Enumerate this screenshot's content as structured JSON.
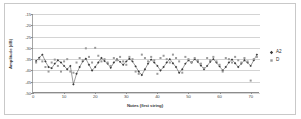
{
  "figure": {
    "y_axis_title": "Amplitude (dB)",
    "x_axis_title": "Notes (first string)",
    "legend": [
      {
        "label": "A2",
        "marker": "diamond-marker",
        "color": "#3a3a3a"
      },
      {
        "label": "D",
        "marker": "square-marker",
        "color": "#9a9a9a"
      }
    ]
  },
  "chart_data": {
    "type": "line",
    "title": "",
    "xlabel": "Notes (first string)",
    "ylabel": "Amplitude (dB)",
    "xlim": [
      0,
      73
    ],
    "ylim": [
      -50,
      -15
    ],
    "xticks": [
      0,
      10,
      20,
      30,
      40,
      50,
      60,
      70
    ],
    "yticks": [
      -15,
      -20,
      -25,
      -30,
      -35,
      -40,
      -45,
      -50
    ],
    "grid": true,
    "legend_position": "right",
    "series": [
      {
        "name": "A2",
        "marker": "diamond",
        "color": "#3a3a3a",
        "line": true,
        "x": [
          1,
          2,
          3,
          4,
          5,
          6,
          7,
          8,
          9,
          10,
          11,
          12,
          13,
          14,
          15,
          16,
          17,
          18,
          19,
          20,
          21,
          22,
          23,
          24,
          25,
          26,
          27,
          28,
          29,
          30,
          31,
          32,
          33,
          34,
          35,
          36,
          37,
          38,
          39,
          40,
          41,
          42,
          43,
          44,
          45,
          46,
          47,
          48,
          49,
          50,
          51,
          52,
          53,
          54,
          55,
          56,
          57,
          58,
          59,
          60,
          61,
          62,
          63,
          64,
          65,
          66,
          67,
          68,
          69,
          70,
          71,
          72
        ],
        "values": [
          -35.8,
          -34.4,
          -33.0,
          -36.0,
          -38.5,
          -39.0,
          -37.0,
          -35.5,
          -36.5,
          -38.0,
          -39.5,
          -38.0,
          -46.2,
          -41.5,
          -38.5,
          -36.0,
          -34.8,
          -37.5,
          -40.0,
          -38.5,
          -36.5,
          -34.5,
          -35.8,
          -37.0,
          -38.8,
          -36.5,
          -35.0,
          -36.2,
          -37.5,
          -36.0,
          -34.8,
          -36.0,
          -38.2,
          -40.5,
          -42.0,
          -39.5,
          -37.0,
          -35.2,
          -36.5,
          -38.0,
          -40.0,
          -38.5,
          -36.5,
          -35.0,
          -36.8,
          -38.5,
          -41.0,
          -39.5,
          -37.0,
          -35.5,
          -36.5,
          -35.0,
          -36.2,
          -37.8,
          -39.5,
          -38.0,
          -36.2,
          -35.0,
          -36.5,
          -38.2,
          -40.0,
          -38.5,
          -36.5,
          -35.2,
          -36.8,
          -38.5,
          -37.0,
          -35.5,
          -36.5,
          -38.0,
          -35.5,
          -33.0
        ]
      },
      {
        "name": "D",
        "marker": "square",
        "color": "#9a9a9a",
        "line": false,
        "x": [
          1,
          2,
          3,
          4,
          5,
          6,
          7,
          8,
          9,
          10,
          11,
          12,
          13,
          14,
          15,
          16,
          17,
          18,
          19,
          20,
          21,
          22,
          23,
          24,
          25,
          26,
          27,
          28,
          29,
          30,
          31,
          32,
          33,
          34,
          35,
          36,
          37,
          38,
          39,
          40,
          41,
          42,
          43,
          44,
          45,
          46,
          47,
          48,
          49,
          50,
          51,
          52,
          53,
          54,
          55,
          56,
          57,
          58,
          59,
          60,
          61,
          62,
          63,
          64,
          65,
          66,
          67,
          68,
          69,
          70,
          71,
          72
        ],
        "values": [
          -36.5,
          -35.0,
          -36.0,
          -38.5,
          -40.5,
          -36.5,
          -35.2,
          -38.0,
          -40.5,
          -36.0,
          -35.0,
          -40.5,
          -41.0,
          -36.5,
          -34.5,
          -35.5,
          -30.2,
          -34.0,
          -36.5,
          -30.0,
          -33.5,
          -36.0,
          -35.0,
          -36.5,
          -38.0,
          -34.5,
          -35.5,
          -34.0,
          -36.0,
          -37.5,
          -34.0,
          -35.0,
          -40.5,
          -41.5,
          -33.0,
          -34.5,
          -36.0,
          -34.0,
          -35.5,
          -41.5,
          -34.5,
          -33.5,
          -35.0,
          -36.5,
          -33.0,
          -34.5,
          -36.0,
          -41.0,
          -34.0,
          -35.0,
          -36.5,
          -34.5,
          -35.5,
          -37.0,
          -39.0,
          -34.5,
          -35.5,
          -34.0,
          -36.0,
          -37.5,
          -40.5,
          -34.5,
          -35.0,
          -36.5,
          -34.0,
          -35.5,
          -36.5,
          -34.5,
          -36.0,
          -44.5,
          -35.0,
          -34.0
        ]
      }
    ]
  }
}
